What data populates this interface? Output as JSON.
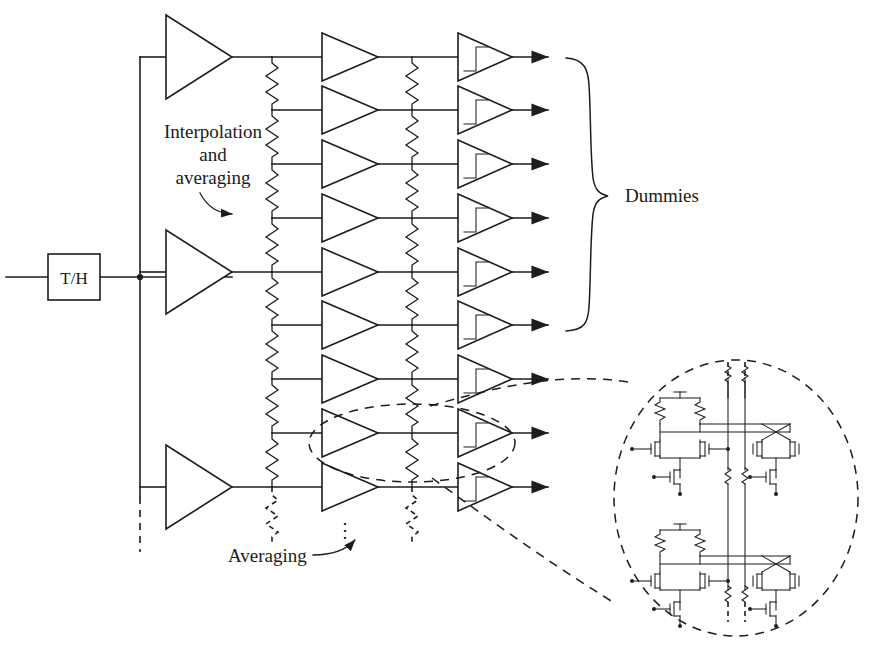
{
  "figure": {
    "domain": "Diagram",
    "kind": "circuit-block-diagram",
    "title_text": "",
    "background_color": "#ffffff",
    "ink_color": "#1d1d1d",
    "width": 884,
    "height": 662
  },
  "blocks": {
    "track_and_hold": {
      "label": "T/H",
      "x": 48,
      "y": 254,
      "w": 52,
      "h": 46
    }
  },
  "labels": {
    "interpolation": {
      "line1": "Interpolation",
      "line2": "and",
      "line3": "averaging",
      "x": 213,
      "y": 131
    },
    "dummies": {
      "text": "Dummies",
      "x": 625,
      "y": 201
    },
    "averaging": {
      "text": "Averaging",
      "x": 285,
      "y": 556
    },
    "vertical_ellipsis": {
      "text": "⋮",
      "x": 345,
      "y": 530
    }
  },
  "rows": {
    "count": 9,
    "y_positions": [
      57,
      110,
      164,
      218,
      272,
      325,
      379,
      433,
      487
    ],
    "input_amplifier_rows": [
      0,
      4,
      8
    ],
    "dummy_rows": [
      0,
      1,
      2,
      3,
      4,
      5
    ]
  },
  "columns": {
    "input_wire_x": 140,
    "preamp_tip_x": 232,
    "resistor_ladder_1_x": 272,
    "interp_amp_left_x": 322,
    "interp_amp_tip_x": 378,
    "resistor_ladder_2_x": 412,
    "latch_left_x": 458,
    "latch_tip_x": 512,
    "output_arrow_x": 548
  },
  "symbols": {
    "input_amplifier": "triangle-amplifier",
    "interpolation_amplifier": "triangle-amplifier",
    "latch": "triangle-latch-with-step",
    "resistor": "zigzag-resistor",
    "output": "solid-arrowhead",
    "continuation": "dashed-line"
  },
  "detail_view": {
    "name": "transistor-level-detail",
    "callout_shape": "dashed-ellipse",
    "source_ellipse": {
      "cx": 412,
      "cy": 443,
      "rx": 103,
      "ry": 39
    },
    "target_ellipse": {
      "cx": 736,
      "cy": 498,
      "rx": 122,
      "ry": 138
    },
    "cell_count": 2,
    "cell_description": "differential-pair-preamp-with-resistive-load-and-cross-coupled-latch",
    "sub_blocks": [
      "load-resistor-pair",
      "differential-input-pair",
      "tail-current-source",
      "cross-coupled-latch-pair",
      "latch-tail-current-source",
      "averaging-resistor-ladder-left",
      "averaging-resistor-ladder-right"
    ]
  },
  "annotations": {
    "interpolation_arrow": "curved-arrow-down-right",
    "averaging_arrow": "curved-arrow-up-right",
    "dummies_brace": "right-facing-curly-brace"
  }
}
